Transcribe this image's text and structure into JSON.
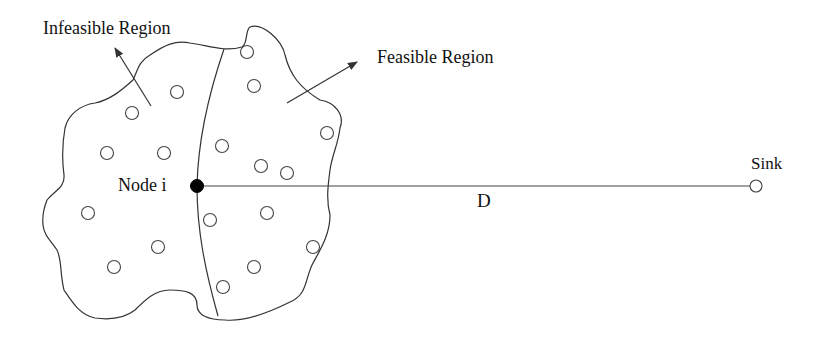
{
  "diagram": {
    "labels": {
      "infeasible_region": "Infeasible Region",
      "feasible_region": "Feasible Region",
      "node_i": "Node i",
      "distance": "D",
      "sink": "Sink"
    },
    "colors": {
      "stroke": "#333333",
      "node_fill": "#ffffff",
      "highlight_node_fill": "#000000",
      "background": "#ffffff"
    },
    "nodes": [
      {
        "x": 177,
        "y": 92
      },
      {
        "x": 132,
        "y": 113
      },
      {
        "x": 107,
        "y": 153
      },
      {
        "x": 164,
        "y": 153
      },
      {
        "x": 247,
        "y": 52
      },
      {
        "x": 254,
        "y": 86
      },
      {
        "x": 222,
        "y": 146
      },
      {
        "x": 261,
        "y": 166
      },
      {
        "x": 287,
        "y": 173
      },
      {
        "x": 327,
        "y": 133
      },
      {
        "x": 88,
        "y": 213
      },
      {
        "x": 158,
        "y": 247
      },
      {
        "x": 114,
        "y": 267
      },
      {
        "x": 210,
        "y": 220
      },
      {
        "x": 267,
        "y": 213
      },
      {
        "x": 313,
        "y": 247
      },
      {
        "x": 254,
        "y": 267
      },
      {
        "x": 223,
        "y": 287
      }
    ],
    "node_i": {
      "x": 197,
      "y": 186
    },
    "sink": {
      "x": 756,
      "y": 186
    }
  }
}
